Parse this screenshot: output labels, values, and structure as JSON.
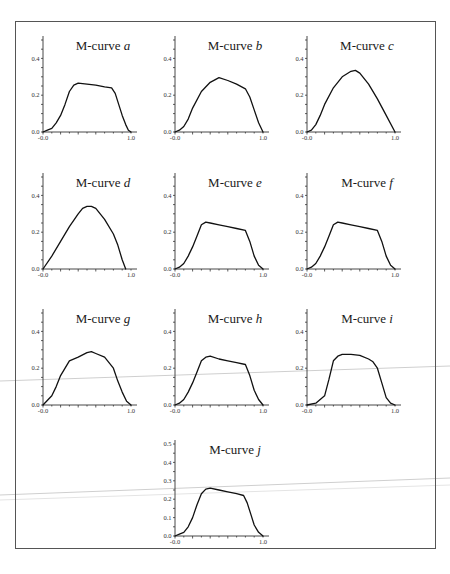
{
  "figure": {
    "frame_color": "#555555",
    "curve_color": "#111111",
    "background": "#ffffff"
  },
  "chart_data": [
    {
      "type": "line",
      "id": "a",
      "title": "M-curve a",
      "title_prefix": "M-curve",
      "title_letter": "a",
      "xlabel": "",
      "ylabel": "",
      "xlim": [
        0.0,
        1.0
      ],
      "ylim": [
        0.0,
        0.5
      ],
      "x_tick_labels": [
        "-0.0",
        "1.0"
      ],
      "y_tick_labels": [
        "0.0",
        "0.2",
        "0.4"
      ],
      "grid": false,
      "x": [
        0.0,
        0.05,
        0.1,
        0.15,
        0.2,
        0.25,
        0.3,
        0.35,
        0.4,
        0.5,
        0.6,
        0.7,
        0.78,
        0.82,
        0.86,
        0.9,
        0.94,
        0.97,
        1.0
      ],
      "y": [
        0.0,
        0.01,
        0.02,
        0.05,
        0.09,
        0.15,
        0.22,
        0.255,
        0.265,
        0.26,
        0.255,
        0.245,
        0.24,
        0.21,
        0.15,
        0.09,
        0.04,
        0.01,
        0.0
      ]
    },
    {
      "type": "line",
      "id": "b",
      "title": "M-curve b",
      "title_prefix": "M-curve",
      "title_letter": "b",
      "xlabel": "",
      "ylabel": "",
      "xlim": [
        0.0,
        1.0
      ],
      "ylim": [
        0.0,
        0.5
      ],
      "x_tick_labels": [
        "-0.0",
        "1.0"
      ],
      "y_tick_labels": [
        "0.0",
        "0.2",
        "0.4"
      ],
      "grid": false,
      "x": [
        0.0,
        0.05,
        0.1,
        0.15,
        0.2,
        0.3,
        0.4,
        0.5,
        0.6,
        0.7,
        0.8,
        0.85,
        0.9,
        0.95,
        1.0
      ],
      "y": [
        0.0,
        0.01,
        0.03,
        0.07,
        0.13,
        0.22,
        0.27,
        0.295,
        0.28,
        0.26,
        0.235,
        0.19,
        0.12,
        0.05,
        0.0
      ]
    },
    {
      "type": "line",
      "id": "c",
      "title": "M-curve c",
      "title_prefix": "M-curve",
      "title_letter": "c",
      "xlabel": "",
      "ylabel": "",
      "xlim": [
        0.0,
        1.0
      ],
      "ylim": [
        0.0,
        0.5
      ],
      "x_tick_labels": [
        "-0.0",
        "1.0"
      ],
      "y_tick_labels": [
        "0.0",
        "0.2",
        "0.4"
      ],
      "grid": false,
      "x": [
        0.0,
        0.05,
        0.1,
        0.15,
        0.2,
        0.3,
        0.4,
        0.5,
        0.55,
        0.6,
        0.7,
        0.8,
        0.9,
        1.0
      ],
      "y": [
        0.0,
        0.01,
        0.04,
        0.09,
        0.15,
        0.24,
        0.3,
        0.33,
        0.335,
        0.32,
        0.26,
        0.18,
        0.09,
        0.0
      ]
    },
    {
      "type": "line",
      "id": "d",
      "title": "M-curve d",
      "title_prefix": "M-curve",
      "title_letter": "d",
      "xlabel": "",
      "ylabel": "",
      "xlim": [
        0.0,
        1.0
      ],
      "ylim": [
        0.0,
        0.5
      ],
      "x_tick_labels": [
        "-0.0",
        "1.0"
      ],
      "y_tick_labels": [
        "0.0",
        "0.2",
        "0.4"
      ],
      "grid": false,
      "x": [
        0.0,
        0.1,
        0.2,
        0.3,
        0.4,
        0.45,
        0.5,
        0.55,
        0.6,
        0.7,
        0.8,
        0.85,
        0.9,
        0.94
      ],
      "y": [
        0.0,
        0.07,
        0.15,
        0.23,
        0.3,
        0.33,
        0.34,
        0.34,
        0.33,
        0.27,
        0.19,
        0.13,
        0.05,
        0.0
      ]
    },
    {
      "type": "line",
      "id": "e",
      "title": "M-curve e",
      "title_prefix": "M-curve",
      "title_letter": "e",
      "xlabel": "",
      "ylabel": "",
      "xlim": [
        0.0,
        1.0
      ],
      "ylim": [
        0.0,
        0.5
      ],
      "x_tick_labels": [
        "-0.0",
        "1.0"
      ],
      "y_tick_labels": [
        "0.0",
        "0.2",
        "0.4"
      ],
      "grid": false,
      "x": [
        0.0,
        0.05,
        0.1,
        0.15,
        0.2,
        0.25,
        0.3,
        0.35,
        0.4,
        0.5,
        0.6,
        0.7,
        0.8,
        0.85,
        0.9,
        0.95,
        1.0
      ],
      "y": [
        0.0,
        0.01,
        0.03,
        0.07,
        0.12,
        0.18,
        0.24,
        0.255,
        0.25,
        0.24,
        0.23,
        0.22,
        0.21,
        0.15,
        0.07,
        0.02,
        0.0
      ]
    },
    {
      "type": "line",
      "id": "f",
      "title": "M-curve f",
      "title_prefix": "M-curve",
      "title_letter": "f",
      "xlabel": "",
      "ylabel": "",
      "xlim": [
        0.0,
        1.0
      ],
      "ylim": [
        0.0,
        0.5
      ],
      "x_tick_labels": [
        "-0.0",
        "1.0"
      ],
      "y_tick_labels": [
        "0.0",
        "0.2",
        "0.4"
      ],
      "grid": false,
      "x": [
        0.0,
        0.05,
        0.1,
        0.15,
        0.2,
        0.25,
        0.3,
        0.35,
        0.4,
        0.5,
        0.6,
        0.7,
        0.8,
        0.85,
        0.9,
        0.95,
        1.0
      ],
      "y": [
        0.0,
        0.01,
        0.03,
        0.07,
        0.12,
        0.18,
        0.24,
        0.255,
        0.25,
        0.24,
        0.23,
        0.22,
        0.21,
        0.15,
        0.07,
        0.02,
        0.0
      ]
    },
    {
      "type": "line",
      "id": "g",
      "title": "M-curve g",
      "title_prefix": "M-curve",
      "title_letter": "g",
      "xlabel": "",
      "ylabel": "",
      "xlim": [
        0.0,
        1.0
      ],
      "ylim": [
        0.0,
        0.5
      ],
      "x_tick_labels": [
        "-0.0",
        "1.0"
      ],
      "y_tick_labels": [
        "0.0",
        "0.2",
        "0.4"
      ],
      "grid": false,
      "x": [
        0.0,
        0.1,
        0.15,
        0.2,
        0.3,
        0.4,
        0.5,
        0.55,
        0.6,
        0.7,
        0.8,
        0.85,
        0.9,
        0.95,
        1.0
      ],
      "y": [
        0.0,
        0.05,
        0.1,
        0.16,
        0.24,
        0.26,
        0.285,
        0.29,
        0.28,
        0.26,
        0.2,
        0.13,
        0.07,
        0.02,
        0.0
      ]
    },
    {
      "type": "line",
      "id": "h",
      "title": "M-curve h",
      "title_prefix": "M-curve",
      "title_letter": "h",
      "xlabel": "",
      "ylabel": "",
      "xlim": [
        0.0,
        1.0
      ],
      "ylim": [
        0.0,
        0.5
      ],
      "x_tick_labels": [
        "-0.0",
        "1.0"
      ],
      "y_tick_labels": [
        "0.0",
        "0.2",
        "0.4"
      ],
      "grid": false,
      "x": [
        0.0,
        0.05,
        0.1,
        0.15,
        0.2,
        0.25,
        0.3,
        0.35,
        0.4,
        0.5,
        0.6,
        0.7,
        0.8,
        0.85,
        0.9,
        0.95,
        1.0
      ],
      "y": [
        0.0,
        0.01,
        0.03,
        0.07,
        0.12,
        0.18,
        0.24,
        0.26,
        0.265,
        0.25,
        0.24,
        0.23,
        0.22,
        0.16,
        0.08,
        0.03,
        0.0
      ]
    },
    {
      "type": "line",
      "id": "i",
      "title": "M-curve i",
      "title_prefix": "M-curve",
      "title_letter": "i",
      "xlabel": "",
      "ylabel": "",
      "xlim": [
        0.0,
        1.0
      ],
      "ylim": [
        0.0,
        0.5
      ],
      "x_tick_labels": [
        "-0.0",
        "1.0"
      ],
      "y_tick_labels": [
        "0.0",
        "0.2",
        "0.4"
      ],
      "grid": false,
      "x": [
        0.0,
        0.1,
        0.2,
        0.25,
        0.3,
        0.35,
        0.4,
        0.5,
        0.6,
        0.7,
        0.75,
        0.8,
        0.85,
        0.9,
        0.95,
        1.0
      ],
      "y": [
        0.0,
        0.01,
        0.05,
        0.14,
        0.24,
        0.265,
        0.275,
        0.275,
        0.27,
        0.25,
        0.235,
        0.2,
        0.12,
        0.04,
        0.01,
        0.0
      ]
    },
    {
      "type": "line",
      "id": "j",
      "title": "M-curve j",
      "title_prefix": "M-curve",
      "title_letter": "j",
      "xlabel": "",
      "ylabel": "",
      "xlim": [
        0.0,
        1.0
      ],
      "ylim": [
        0.0,
        0.5
      ],
      "x_tick_labels": [
        "-0.0",
        "1.0"
      ],
      "y_tick_labels": [
        "0.0",
        "0.1",
        "0.2",
        "0.3",
        "0.4",
        "0.5"
      ],
      "grid": false,
      "x": [
        0.0,
        0.05,
        0.1,
        0.15,
        0.2,
        0.25,
        0.3,
        0.35,
        0.4,
        0.5,
        0.6,
        0.7,
        0.78,
        0.82,
        0.86,
        0.9,
        0.95,
        1.0
      ],
      "y": [
        0.0,
        0.01,
        0.02,
        0.05,
        0.1,
        0.17,
        0.23,
        0.255,
        0.26,
        0.25,
        0.24,
        0.23,
        0.22,
        0.18,
        0.12,
        0.06,
        0.02,
        0.0
      ]
    }
  ]
}
